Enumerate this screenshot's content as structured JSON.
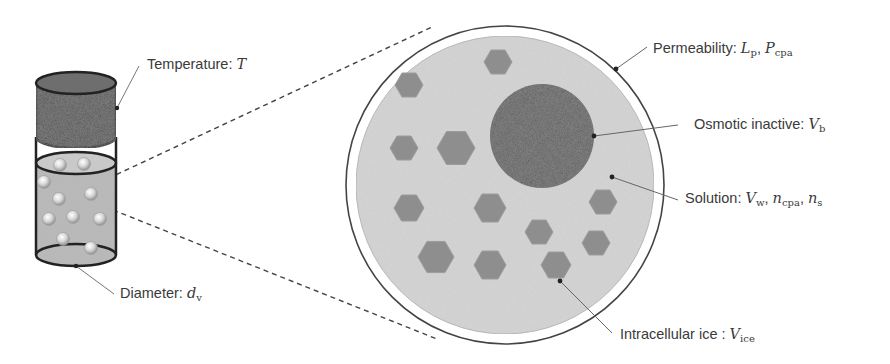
{
  "diagram": {
    "vial": {
      "cap_color": "#555555",
      "liquid_color": "#b8b8b8",
      "outline_color": "#222222"
    },
    "cell": {
      "membrane_color": "#444444",
      "cytoplasm_color": "#d4d4d4",
      "nucleus_color": "#5e5e5e",
      "ice_color": "#8e8e8e"
    },
    "labels": {
      "temperature": {
        "text": "Temperature: ",
        "symbol": "T",
        "subscript": ""
      },
      "diameter": {
        "text": "Diameter: ",
        "symbol": "d",
        "subscript": "v"
      },
      "permeability": {
        "text": "Permeability: ",
        "symbol1": "L",
        "sub1": "p",
        "sep": ", ",
        "symbol2": "P",
        "sub2": "cpa"
      },
      "osmotic_inactive": {
        "text": "Osmotic inactive: ",
        "symbol": "V",
        "subscript": "b"
      },
      "solution": {
        "text": "Solution: ",
        "symbol1": "V",
        "sub1": "w",
        "sep1": ", ",
        "symbol2": "n",
        "sub2": "cpa",
        "sep2": ", ",
        "symbol3": "n",
        "sub3": "s"
      },
      "intracellular_ice": {
        "text": "Intracellular ice : ",
        "symbol": "V",
        "subscript": "ice"
      }
    }
  }
}
